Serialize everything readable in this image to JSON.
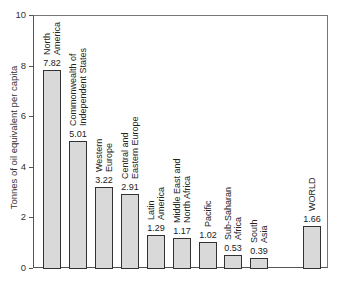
{
  "chart_data": {
    "type": "bar",
    "title": "",
    "xlabel": "",
    "ylabel": "Tonnes of oil equivalent per capita",
    "ylim": [
      0,
      10
    ],
    "yticks": [
      0,
      2,
      4,
      6,
      8,
      10
    ],
    "grid": false,
    "legend": null,
    "categories": [
      "North America",
      "Commonwealth of Independent States",
      "Western Europe",
      "Central and Eastern Europe",
      "Latin America",
      "Middle East and North Africa",
      "Pacific",
      "Sub-Saharan Africa",
      "South Asia",
      "WORLD"
    ],
    "category_lines": [
      [
        "North",
        "America"
      ],
      [
        "Commonwealth of",
        "Independent States"
      ],
      [
        "Western",
        "Europe"
      ],
      [
        "Central and",
        "Eastern Europe"
      ],
      [
        "Latin",
        "America"
      ],
      [
        "Middle East and",
        "North Africa"
      ],
      [
        "Pacific"
      ],
      [
        "Sub-Saharan",
        "Africa"
      ],
      [
        "South",
        "Asia"
      ],
      [
        "WORLD"
      ]
    ],
    "values": [
      7.82,
      5.01,
      3.22,
      2.91,
      1.29,
      1.17,
      1.02,
      0.53,
      0.39,
      1.66
    ],
    "value_labels": [
      "7.82",
      "5.01",
      "3.22",
      "2.91",
      "1.29",
      "1.17",
      "1.02",
      "0.53",
      "0.39",
      "1.66"
    ],
    "bar_color": "#d9d9d9",
    "bar_edge_color": "#333333"
  }
}
